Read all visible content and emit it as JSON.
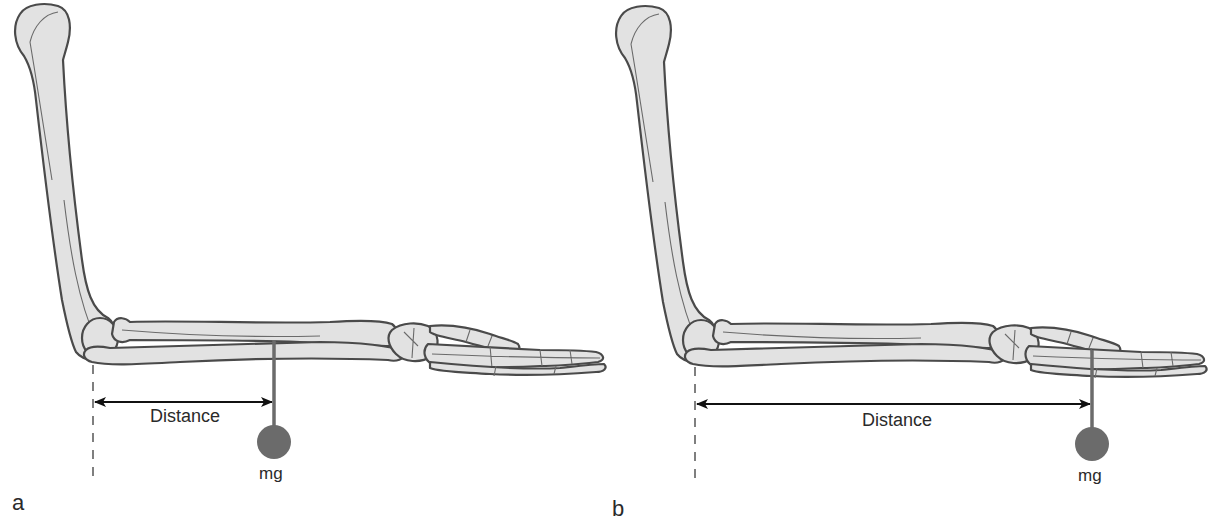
{
  "figure": {
    "panels": [
      {
        "id": "a",
        "label": "a",
        "distance_label": "Distance",
        "load_label": "mg",
        "load_position": "mid-forearm",
        "colors": {
          "bone_fill": "#e2e2e2",
          "bone_outline": "#4a4a4a",
          "weight": "#6b6b6b",
          "arrow": "#111111"
        }
      },
      {
        "id": "b",
        "label": "b",
        "distance_label": "Distance",
        "load_label": "mg",
        "load_position": "hand",
        "colors": {
          "bone_fill": "#e2e2e2",
          "bone_outline": "#4a4a4a",
          "weight": "#6b6b6b",
          "arrow": "#111111"
        }
      }
    ]
  }
}
